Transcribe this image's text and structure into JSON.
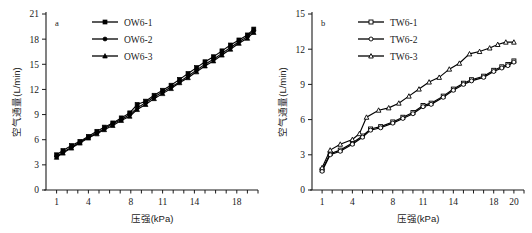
{
  "figure": {
    "title": "",
    "panels": [
      "a",
      "b"
    ]
  },
  "chart_data": [
    {
      "type": "line",
      "panel_label": "a",
      "title": "",
      "xlabel": "压强(kPa)",
      "ylabel": "空气通量(L/min)",
      "xlim": [
        0,
        20
      ],
      "ylim": [
        0,
        21
      ],
      "xticks": [
        1,
        4,
        8,
        11,
        14,
        18
      ],
      "yticks": [
        0,
        3,
        6,
        9,
        12,
        15,
        18,
        21
      ],
      "grid": false,
      "legend_position": "top-center",
      "series": [
        {
          "name": "OW6-1",
          "marker": "filled-square",
          "x": [
            1.0,
            1.6,
            2.4,
            3.2,
            4.0,
            4.8,
            5.5,
            6.3,
            7.1,
            7.9,
            8.6,
            9.4,
            10.2,
            11.0,
            11.8,
            12.6,
            13.4,
            14.2,
            15.0,
            15.8,
            16.6,
            17.4,
            18.2,
            19.0,
            19.6
          ],
          "y": [
            4.2,
            4.7,
            5.3,
            5.8,
            6.4,
            7.0,
            7.5,
            8.0,
            8.6,
            9.2,
            10.2,
            10.6,
            11.3,
            11.9,
            12.5,
            13.2,
            13.9,
            14.6,
            15.3,
            15.9,
            16.6,
            17.3,
            17.9,
            18.5,
            19.2
          ]
        },
        {
          "name": "OW6-2",
          "marker": "filled-circle",
          "x": [
            1.0,
            1.6,
            2.4,
            3.2,
            4.0,
            4.8,
            5.5,
            6.3,
            7.1,
            7.9,
            8.6,
            9.4,
            10.2,
            11.0,
            11.8,
            12.6,
            13.4,
            14.2,
            15.0,
            15.8,
            16.6,
            17.4,
            18.2,
            19.0,
            19.6
          ],
          "y": [
            4.0,
            4.5,
            5.1,
            5.7,
            6.3,
            6.8,
            7.3,
            7.9,
            8.4,
            9.0,
            9.8,
            10.4,
            11.1,
            11.7,
            12.3,
            12.9,
            13.6,
            14.3,
            15.0,
            15.6,
            16.3,
            17.0,
            17.7,
            18.3,
            19.0
          ]
        },
        {
          "name": "OW6-3",
          "marker": "filled-triangle",
          "x": [
            1.0,
            1.6,
            2.4,
            3.2,
            4.0,
            4.8,
            5.5,
            6.3,
            7.1,
            7.9,
            8.6,
            9.4,
            10.2,
            11.0,
            11.8,
            12.6,
            13.4,
            14.2,
            15.0,
            15.8,
            16.6,
            17.4,
            18.2,
            19.0,
            19.6
          ],
          "y": [
            3.9,
            4.4,
            5.0,
            5.6,
            6.2,
            6.7,
            7.2,
            7.7,
            8.3,
            8.8,
            9.6,
            10.2,
            10.9,
            11.5,
            12.1,
            12.8,
            13.4,
            14.1,
            14.8,
            15.4,
            16.1,
            16.8,
            17.5,
            18.1,
            18.8
          ]
        }
      ]
    },
    {
      "type": "line",
      "panel_label": "b",
      "title": "",
      "xlabel": "压强(kPa)",
      "ylabel": "空气通量(L/min)",
      "xlim": [
        0,
        21
      ],
      "ylim": [
        0,
        15
      ],
      "xticks": [
        1,
        4,
        8,
        11,
        14,
        18,
        20
      ],
      "yticks": [
        0,
        3,
        6,
        9,
        12,
        15
      ],
      "grid": false,
      "legend_position": "top-center",
      "series": [
        {
          "name": "TW6-1",
          "marker": "hollow-square",
          "x": [
            1.0,
            1.8,
            2.8,
            4.0,
            5.0,
            5.8,
            6.8,
            8.0,
            9.0,
            10.0,
            11.0,
            11.8,
            13.0,
            14.0,
            15.0,
            15.8,
            17.0,
            18.0,
            18.8,
            19.4,
            20.0
          ],
          "y": [
            1.7,
            3.1,
            3.4,
            4.0,
            4.6,
            5.2,
            5.4,
            5.8,
            6.2,
            6.6,
            7.2,
            7.4,
            8.0,
            8.6,
            9.1,
            9.4,
            9.7,
            10.2,
            10.5,
            10.7,
            11.0
          ]
        },
        {
          "name": "TW6-2",
          "marker": "hollow-circle",
          "x": [
            1.0,
            1.8,
            2.8,
            4.0,
            5.0,
            5.8,
            6.8,
            8.0,
            9.0,
            10.0,
            11.0,
            11.8,
            13.0,
            14.0,
            15.0,
            15.8,
            17.0,
            18.0,
            18.8,
            19.4,
            20.0
          ],
          "y": [
            1.6,
            3.0,
            3.3,
            3.9,
            4.5,
            5.1,
            5.3,
            5.7,
            6.1,
            6.5,
            7.1,
            7.3,
            7.9,
            8.5,
            9.0,
            9.3,
            9.6,
            10.1,
            10.4,
            10.6,
            10.9
          ]
        },
        {
          "name": "TW6-3",
          "marker": "hollow-triangle",
          "x": [
            1.0,
            1.8,
            2.8,
            4.0,
            4.7,
            5.4,
            6.6,
            7.6,
            8.6,
            9.6,
            10.6,
            11.6,
            12.6,
            13.6,
            14.6,
            15.6,
            16.6,
            17.6,
            18.4,
            19.2,
            20.0
          ],
          "y": [
            1.9,
            3.4,
            3.9,
            4.3,
            4.8,
            6.2,
            6.8,
            7.0,
            7.4,
            8.0,
            8.6,
            9.2,
            9.6,
            10.3,
            10.8,
            11.6,
            11.8,
            12.1,
            12.4,
            12.6,
            12.6
          ]
        }
      ]
    }
  ]
}
